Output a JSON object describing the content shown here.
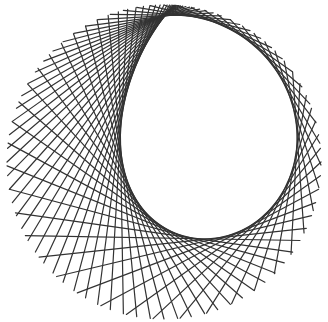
{
  "artwork": {
    "description": "String-art line pattern forming a ring of chords with an offset circular inner envelope",
    "background_color": "#ffffff",
    "stroke_color": "#333333",
    "stroke_width": 1.2,
    "outer_circle": {
      "cx": 164,
      "cy": 162,
      "r": 157
    },
    "line_count": 72,
    "chord_span_min_deg": 38,
    "chord_span_max_deg": 150,
    "span_phase_deg": 0,
    "rotation_deg": -90
  }
}
